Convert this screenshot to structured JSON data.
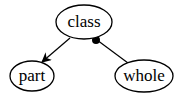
{
  "diagram": {
    "nodes": [
      {
        "id": "class",
        "label": "class",
        "cx": 84,
        "cy": 22,
        "rx": 28,
        "ry": 17
      },
      {
        "id": "part",
        "label": "part",
        "cx": 32,
        "cy": 76,
        "rx": 22,
        "ry": 15
      },
      {
        "id": "whole",
        "label": "whole",
        "cx": 144,
        "cy": 76,
        "rx": 29,
        "ry": 16
      }
    ],
    "edges": [
      {
        "from": "class",
        "to": "part",
        "type": "arrow"
      },
      {
        "from": "whole",
        "to": "class",
        "type": "filled-dot-end"
      }
    ],
    "colors": {
      "stroke": "#000000",
      "background": "#ffffff"
    }
  }
}
